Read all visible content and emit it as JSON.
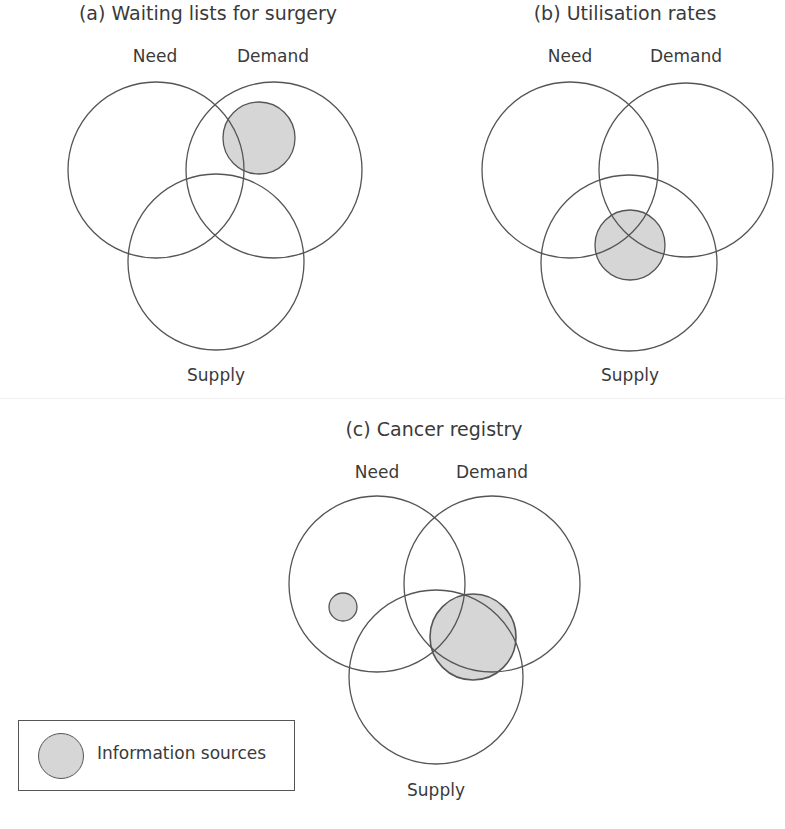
{
  "panels": [
    {
      "title": "(a) Waiting lists for surgery",
      "labels": {
        "need": "Need",
        "demand": "Demand",
        "supply": "Supply"
      },
      "shaded_region": "Demand (partly overlapping Need)"
    },
    {
      "title": "(b) Utilisation rates",
      "labels": {
        "need": "Need",
        "demand": "Demand",
        "supply": "Supply"
      },
      "shaded_region": "Centre intersection of Need, Demand and Supply"
    },
    {
      "title": "(c) Cancer registry",
      "labels": {
        "need": "Need",
        "demand": "Demand",
        "supply": "Supply"
      },
      "shaded_region": "Small source in Need only; large source over Demand/Supply intersection"
    }
  ],
  "legend": {
    "label": "Information sources",
    "swatch_color": "#d6d6d6"
  },
  "colors": {
    "stroke": "#555555",
    "fill": "#d6d6d6",
    "background": "#ffffff"
  }
}
